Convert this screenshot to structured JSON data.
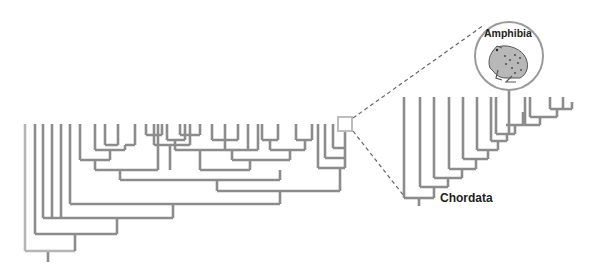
{
  "diagram": {
    "type": "phylogenetic-tree",
    "colors": {
      "branch": "#8c8c8c",
      "root_branch": "#b5b5b5",
      "highlight_box": "#bdbdbd",
      "dashed_line": "#666666",
      "circle_stroke": "#9a9a9a",
      "label": "#222222"
    },
    "labels": {
      "clade": "Chordata",
      "highlight": "Amphibia"
    },
    "icons": {
      "highlight_image": "frog-icon"
    }
  }
}
